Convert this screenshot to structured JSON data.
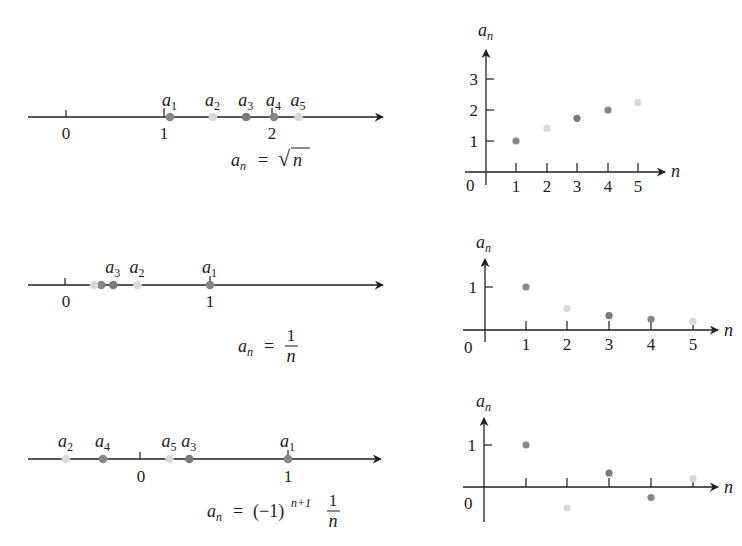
{
  "figure": {
    "panels": [
      {
        "id": "sqrt",
        "formula": {
          "lhs_base": "a",
          "lhs_sub": "n",
          "equals": "=",
          "rhs": "√n",
          "rhs_text": "√",
          "rhs_var": "n"
        },
        "number_line": {
          "tick_labels": [
            "0",
            "1",
            "2"
          ],
          "points": [
            {
              "label_base": "a",
              "label_sub": "1",
              "value": 1.0
            },
            {
              "label_base": "a",
              "label_sub": "2",
              "value": 1.414
            },
            {
              "label_base": "a",
              "label_sub": "3",
              "value": 1.732
            },
            {
              "label_base": "a",
              "label_sub": "4",
              "value": 2.0
            },
            {
              "label_base": "a",
              "label_sub": "5",
              "value": 2.236
            }
          ]
        }
      },
      {
        "id": "reciprocal",
        "formula": {
          "lhs_base": "a",
          "lhs_sub": "n",
          "equals": "=",
          "rhs_num": "1",
          "rhs_den": "n"
        },
        "number_line": {
          "tick_labels": [
            "0",
            "1"
          ],
          "points": [
            {
              "label_base": "a",
              "label_sub": "1",
              "value": 1.0
            },
            {
              "label_base": "a",
              "label_sub": "2",
              "value": 0.5
            },
            {
              "label_base": "a",
              "label_sub": "3",
              "value": 0.333
            },
            {
              "label_base": "a",
              "label_sub": "4",
              "value": 0.25
            },
            {
              "label_base": "a",
              "label_sub": "5",
              "value": 0.2
            }
          ]
        }
      },
      {
        "id": "alternating",
        "formula": {
          "lhs_base": "a",
          "lhs_sub": "n",
          "equals": "=",
          "rhs_paren": "(−1)",
          "rhs_exp": "n+1",
          "rhs_num": "1",
          "rhs_den": "n"
        },
        "number_line": {
          "tick_labels": [
            "0",
            "1"
          ],
          "points": [
            {
              "label_base": "a",
              "label_sub": "1",
              "value": 1.0
            },
            {
              "label_base": "a",
              "label_sub": "2",
              "value": -0.5
            },
            {
              "label_base": "a",
              "label_sub": "3",
              "value": 0.333
            },
            {
              "label_base": "a",
              "label_sub": "4",
              "value": -0.25
            },
            {
              "label_base": "a",
              "label_sub": "5",
              "value": 0.2
            }
          ]
        }
      }
    ],
    "colors": {
      "dark": "#878787",
      "light": "#d9d9d9",
      "darker": "#7a7a7a",
      "axis": "#1f1f1f"
    },
    "axis_labels": {
      "x": "n",
      "y_base": "a",
      "y_sub": "n",
      "origin": "0"
    }
  },
  "chart_data": [
    {
      "type": "scatter",
      "title": "a_n = √n",
      "xlabel": "n",
      "ylabel": "a_n",
      "x": [
        1,
        2,
        3,
        4,
        5
      ],
      "values": [
        1.0,
        1.414,
        1.732,
        2.0,
        2.236
      ],
      "xticks": [
        "1",
        "2",
        "3",
        "4",
        "5"
      ],
      "yticks": [
        "1",
        "2",
        "3"
      ],
      "origin_label": "0",
      "ylim": [
        0,
        3.6
      ],
      "grid": false
    },
    {
      "type": "scatter",
      "title": "a_n = 1/n",
      "xlabel": "n",
      "ylabel": "a_n",
      "x": [
        1,
        2,
        3,
        4,
        5
      ],
      "values": [
        1.0,
        0.5,
        0.333,
        0.25,
        0.2
      ],
      "xticks": [
        "1",
        "2",
        "3",
        "4",
        "5"
      ],
      "yticks": [
        "1"
      ],
      "origin_label": "0",
      "ylim": [
        0,
        1.4
      ],
      "grid": false
    },
    {
      "type": "scatter",
      "title": "a_n = (−1)^(n+1) 1/n",
      "xlabel": "n",
      "ylabel": "a_n",
      "x": [
        1,
        2,
        3,
        4,
        5
      ],
      "values": [
        1.0,
        -0.5,
        0.333,
        -0.25,
        0.2
      ],
      "xticks": [],
      "yticks": [
        "1"
      ],
      "origin_label": "0",
      "ylim": [
        -0.8,
        1.5
      ],
      "grid": false
    }
  ]
}
